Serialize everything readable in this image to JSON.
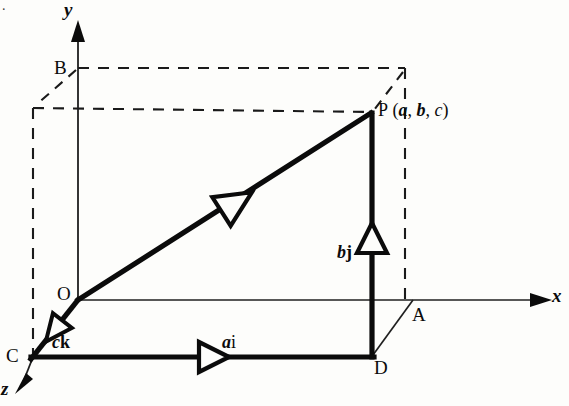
{
  "figure": {
    "background_color": "#fdfdfb",
    "ink_color": "#0b0b0b",
    "corner_artifact": "."
  },
  "axes": [
    {
      "key": "y",
      "label": "y",
      "style": "italic",
      "direction": "up",
      "arrowhead": "solid"
    },
    {
      "key": "x",
      "label": "x",
      "style": "italic",
      "direction": "right",
      "arrowhead": "solid"
    },
    {
      "key": "z",
      "label": "z",
      "style": "italic",
      "direction": "down-left",
      "arrowhead": "solid"
    }
  ],
  "points": [
    {
      "key": "O",
      "label": "O",
      "x": 78,
      "y": 300,
      "role": "origin"
    },
    {
      "key": "B",
      "label": "B",
      "x": 78,
      "y": 68,
      "role": "y-axis point"
    },
    {
      "key": "C",
      "label": "C",
      "x": 33,
      "y": 357,
      "role": "z-axis point"
    },
    {
      "key": "A",
      "label": "A",
      "x": 413,
      "y": 300,
      "role": "x-axis point"
    },
    {
      "key": "D",
      "label": "D",
      "x": 372,
      "y": 355,
      "role": "base corner"
    },
    {
      "key": "P",
      "label": "P",
      "x": 372,
      "y": 112,
      "role": "terminal point"
    }
  ],
  "point_label": {
    "name": "P",
    "open_paren": "(",
    "a": "a",
    "comma1": ",",
    "b": "b",
    "comma2": ",",
    "c": "c",
    "close_paren": ")",
    "full": "P (a, b, c)"
  },
  "vectors": [
    {
      "key": "op",
      "label_plain": "",
      "from": "O",
      "to": "P",
      "weight": "thick",
      "arrow": "hollow-triangle",
      "arrow_at": [
        235,
        203
      ]
    },
    {
      "key": "ck",
      "label_italic": "c",
      "label_bold": "k",
      "label_plain": "ck",
      "from": "O",
      "to": "C",
      "weight": "thick",
      "arrow": "hollow-triangle",
      "arrow_at": [
        55,
        330
      ]
    },
    {
      "key": "ai",
      "label_italic": "a",
      "label_bold": "i",
      "label_plain": "ai",
      "from": "C",
      "to": "D",
      "weight": "thick",
      "arrow": "hollow-triangle",
      "arrow_at": [
        215,
        357
      ]
    },
    {
      "key": "bj",
      "label_italic": "b",
      "label_bold": "j",
      "label_plain": "bj",
      "from": "D",
      "to": "P",
      "weight": "thick",
      "arrow": "hollow-triangle",
      "arrow_at": [
        372,
        240
      ]
    }
  ],
  "construction_lines": {
    "solid_thin": [
      {
        "name": "o-to-a-baseline",
        "from": [
          78,
          300
        ],
        "to": [
          545,
          300
        ]
      },
      {
        "name": "a-to-d",
        "from": [
          413,
          300
        ],
        "to": [
          372,
          355
        ]
      }
    ],
    "dashed": [
      {
        "name": "b-horizontal",
        "from": [
          78,
          68
        ],
        "to": [
          405,
          68
        ]
      },
      {
        "name": "p-horizontal",
        "from": [
          33,
          108
        ],
        "to": [
          372,
          112
        ]
      },
      {
        "name": "left-vertical",
        "from": [
          33,
          108
        ],
        "to": [
          33,
          357
        ]
      },
      {
        "name": "right-vertical",
        "from": [
          405,
          68
        ],
        "to": [
          405,
          300
        ]
      },
      {
        "name": "b-diagonal",
        "from": [
          78,
          68
        ],
        "to": [
          33,
          108
        ]
      },
      {
        "name": "top-diagonal",
        "from": [
          405,
          68
        ],
        "to": [
          372,
          112
        ]
      }
    ]
  },
  "labels": {
    "y_axis": "y",
    "x_axis": "x",
    "z_axis": "z",
    "O": "O",
    "B": "B",
    "C": "C",
    "A": "A",
    "D": "D",
    "ck": "ck",
    "ai": "ai",
    "bj": "bj"
  }
}
